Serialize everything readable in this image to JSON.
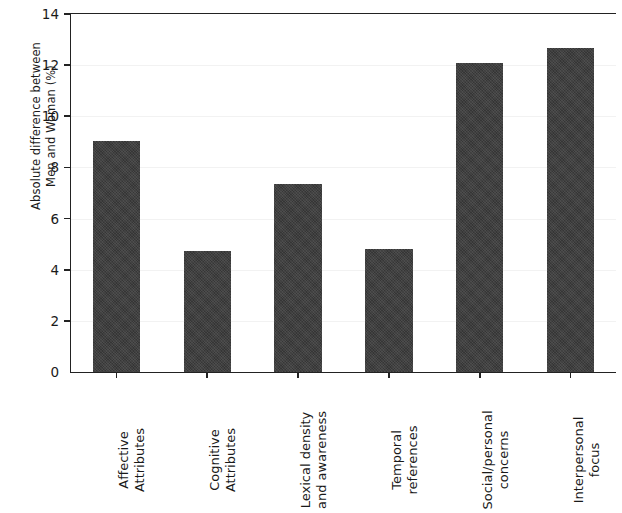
{
  "chart_data": {
    "type": "bar",
    "title": "",
    "xlabel": "",
    "ylabel_line1": "Absolute difference between",
    "ylabel_line2": "Men and Woman (%)",
    "categories": [
      "Affective Attributes",
      "Cognitive Attributes",
      "Lexical density and awareness",
      "Temporal references",
      "Social/personal concerns",
      "Interpersonal focus"
    ],
    "category_lines": [
      [
        "Affective",
        "Attributes"
      ],
      [
        "Cognitive",
        "Attributes"
      ],
      [
        "Lexical density",
        "and awareness"
      ],
      [
        "Temporal",
        "references"
      ],
      [
        "Social/personal",
        "concerns"
      ],
      [
        "Interpersonal",
        "focus"
      ]
    ],
    "values": [
      9.03,
      4.73,
      7.35,
      4.81,
      12.08,
      12.67
    ],
    "ylim": [
      0,
      14
    ],
    "yticks": [
      0,
      2,
      4,
      6,
      8,
      10,
      12,
      14
    ],
    "ytick_labels": [
      "0",
      "2",
      "4",
      "6",
      "8",
      "10",
      "12",
      "14"
    ],
    "grid": true,
    "grid_axis": "y",
    "legend": null,
    "bar_color": "#3b3b3b",
    "grid_color": "#f2f2f2",
    "axis_color": "#222222",
    "background_color": "#ffffff"
  }
}
